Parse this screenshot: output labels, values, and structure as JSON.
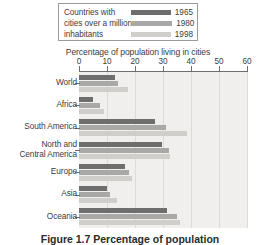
{
  "legend": {
    "description_lines": [
      "Countries with",
      "cities over a million",
      "inhabitants"
    ],
    "entries": [
      {
        "year": "1965",
        "color": "#6e6e6e"
      },
      {
        "year": "1980",
        "color": "#a8a8a6"
      },
      {
        "year": "1998",
        "color": "#cfcecb"
      }
    ]
  },
  "caption": "Figure 1.7 Percentage of population",
  "chart_data": {
    "type": "bar",
    "orientation": "horizontal",
    "title": "Percentage of population living in cities",
    "xlabel": "Percentage of population living in cities",
    "ylabel": "",
    "xlim": [
      0,
      60
    ],
    "xticks": [
      0,
      10,
      20,
      30,
      40,
      50,
      60
    ],
    "xtick_labels": [
      "0",
      "10",
      "20",
      "30",
      "40",
      "50",
      "60"
    ],
    "grid": true,
    "legend_position": "top",
    "categories": [
      "World",
      "Africa",
      "South America",
      "North and Central America",
      "Europe",
      "Asia",
      "Oceania"
    ],
    "series": [
      {
        "name": "1965",
        "color": "#6e6e6e",
        "values": [
          13,
          5,
          27,
          29.5,
          16.5,
          10,
          31.5
        ]
      },
      {
        "name": "1980",
        "color": "#a8a8a6",
        "values": [
          14,
          7.5,
          31,
          32,
          18,
          11,
          35
        ]
      },
      {
        "name": "1998",
        "color": "#cfcecb",
        "values": [
          17.5,
          9,
          38.5,
          32.5,
          19,
          13.5,
          36
        ]
      }
    ]
  }
}
